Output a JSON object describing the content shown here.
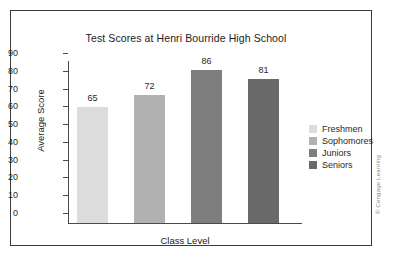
{
  "chart_data": {
    "type": "bar",
    "title": "Test Scores at Henri Bourride High School",
    "xlabel": "Class Level",
    "ylabel": "Average Score",
    "categories": [
      "Freshmen",
      "Sophomores",
      "Juniors",
      "Seniors"
    ],
    "values": [
      65,
      72,
      86,
      81
    ],
    "value_labels": [
      "65",
      "72",
      "86",
      "81"
    ],
    "ylim": [
      0,
      90
    ],
    "ytick_labels": [
      "90",
      "80",
      "70",
      "60",
      "50",
      "40",
      "30",
      "20",
      "10",
      "0"
    ],
    "ytick_values": [
      90,
      80,
      70,
      60,
      50,
      40,
      30,
      20,
      10,
      0
    ],
    "ytick_step": 10,
    "grid": false,
    "xtick_labels": [],
    "legend_position": "right",
    "series": [
      {
        "name": "Average Score",
        "values": [
          65,
          72,
          86,
          81
        ]
      }
    ],
    "bar_colors": [
      "#dcdcdc",
      "#b1b1b1",
      "#7e7e7e",
      "#6a6a6a"
    ]
  },
  "legend": {
    "items": [
      {
        "label": "Freshmen",
        "color": "#dcdcdc"
      },
      {
        "label": "Sophomores",
        "color": "#b1b1b1"
      },
      {
        "label": "Juniors",
        "color": "#7e7e7e"
      },
      {
        "label": "Seniors",
        "color": "#6a6a6a"
      }
    ]
  },
  "credit": {
    "text": "© Cengage Learning"
  },
  "colors": {
    "axis": "#4a4a4a",
    "frame": "#3b3b3b",
    "text": "#1f1f1f",
    "background": "#ffffff"
  }
}
